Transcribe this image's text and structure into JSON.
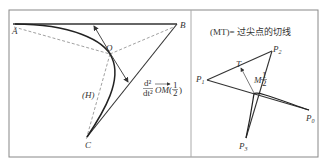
{
  "left_panel": {
    "points": {
      "A": "A",
      "B": "B",
      "C": "C",
      "O": "O"
    },
    "curve_label": "(H)",
    "vector_label": {
      "numerator": "d²",
      "denominator": "dt²",
      "vector": "OM",
      "argument_open": "(",
      "arg_num": "1",
      "arg_den": "2",
      "argument_close": ")"
    }
  },
  "right_panel": {
    "caption": "(MT)= 过尖点的切线",
    "points": {
      "P0": "P",
      "P0_sub": "0",
      "P1": "P",
      "P1_sub": "1",
      "P2": "P",
      "P2_sub": "2",
      "P3": "P",
      "P3_sub": "3",
      "T": "T",
      "M": "M",
      "M_arg_num": "1",
      "M_arg_den": "2"
    }
  },
  "colors": {
    "stroke": "#333333",
    "frame": "#888888",
    "dashed": "#777777"
  }
}
